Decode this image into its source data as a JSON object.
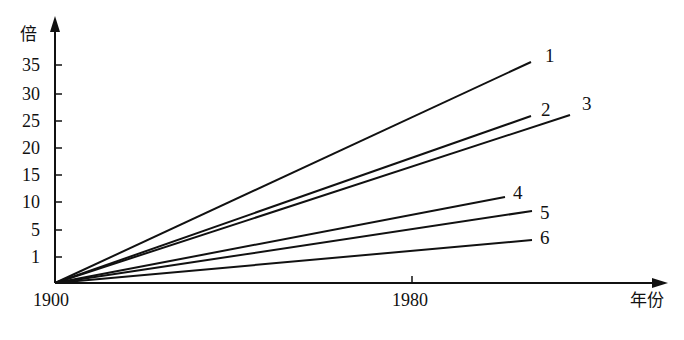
{
  "chart_data": {
    "type": "line",
    "title": "",
    "xlabel": "年份",
    "ylabel": "倍",
    "x_ticks": [
      {
        "label": "1900",
        "year": 1900,
        "px": 55
      },
      {
        "label": "1980",
        "year": 1980,
        "px": 412
      }
    ],
    "y_ticks": [
      {
        "label": "35",
        "value": 35,
        "py": 65
      },
      {
        "label": "30",
        "value": 30,
        "py": 94
      },
      {
        "label": "25",
        "value": 25,
        "py": 121
      },
      {
        "label": "20",
        "value": 20,
        "py": 148
      },
      {
        "label": "15",
        "value": 15,
        "py": 175
      },
      {
        "label": "10",
        "value": 10,
        "py": 202
      },
      {
        "label": "5",
        "value": 5,
        "py": 230
      },
      {
        "label": "1",
        "value": 1,
        "py": 257
      }
    ],
    "xlim": [
      1900,
      2025
    ],
    "ylim": [
      0,
      38
    ],
    "grid": false,
    "legend": "inline labels at line ends",
    "series": [
      {
        "name": "1",
        "x": [
          1900,
          2007
        ],
        "values": [
          0,
          35.5
        ],
        "end_px": [
          531,
          62
        ],
        "label_px": [
          545,
          62
        ]
      },
      {
        "name": "2",
        "x": [
          1900,
          2007
        ],
        "values": [
          0,
          26
        ],
        "end_px": [
          531,
          116
        ],
        "label_px": [
          541,
          116
        ]
      },
      {
        "name": "3",
        "x": [
          1900,
          2015
        ],
        "values": [
          0,
          26
        ],
        "end_px": [
          570,
          115
        ],
        "label_px": [
          582,
          110
        ]
      },
      {
        "name": "4",
        "x": [
          1900,
          2001
        ],
        "values": [
          0,
          11
        ],
        "end_px": [
          505,
          197
        ],
        "label_px": [
          513,
          199
        ]
      },
      {
        "name": "5",
        "x": [
          1900,
          2007
        ],
        "values": [
          0,
          8.5
        ],
        "end_px": [
          532,
          211
        ],
        "label_px": [
          540,
          219
        ]
      },
      {
        "name": "6",
        "x": [
          1900,
          2007
        ],
        "values": [
          0,
          4
        ],
        "end_px": [
          532,
          240
        ],
        "label_px": [
          540,
          244
        ]
      }
    ]
  },
  "axes": {
    "origin_px": [
      55,
      283
    ],
    "x_arrow_tip_px": [
      666,
      283
    ],
    "y_arrow_tip_px": [
      55,
      18
    ],
    "y_title": "倍",
    "x_title": "年份",
    "origin_label": "1900",
    "x_tick_label": "1980"
  },
  "style": {
    "line_color": "#111111",
    "background": "#ffffff"
  }
}
